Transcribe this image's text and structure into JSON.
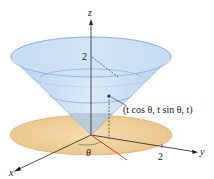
{
  "figure": {
    "axes": {
      "x_label": "x",
      "y_label": "y",
      "z_label": "z"
    },
    "ticks": {
      "z_tick": "2",
      "y_tick": "2"
    },
    "angle_label": "θ",
    "point_label": "(t cos θ, t sin θ, t)",
    "colors": {
      "cone_fill": "#b9d4ef",
      "cone_edge": "#7fa8d6",
      "disc_fill": "#f0cf9c",
      "disc_edge": "#c9a877",
      "radial_line": "#e03a2a",
      "axis": "#222222"
    }
  }
}
